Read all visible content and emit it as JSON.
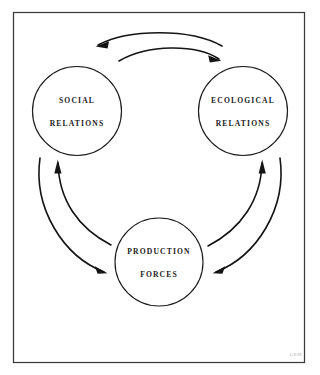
{
  "figure": {
    "background_color": "#ffffff",
    "ink_color": "#141414",
    "frame": {
      "name": "border-frame",
      "stroke_color": "#3b3b3b"
    },
    "monogram": {
      "text": "GEM",
      "color": "#b3b3b3"
    }
  },
  "nodes": [
    {
      "id": "social-relations",
      "line1": "SOCIAL",
      "line2": "RELATIONS",
      "cx": 77,
      "cy": 111,
      "r": 44.5
    },
    {
      "id": "ecological-relations",
      "line1": "ECOLOGICAL",
      "line2": "RELATIONS",
      "cx": 243,
      "cy": 111,
      "r": 44.5
    },
    {
      "id": "production-forces",
      "line1": "PRODUCTION",
      "line2": "FORCES",
      "cx": 159,
      "cy": 262,
      "r": 44.0
    }
  ],
  "arrows": [
    {
      "id": "ecological-to-social",
      "from": "ecological-relations",
      "to": "social-relations",
      "position": "top-outer"
    },
    {
      "id": "social-to-ecological",
      "from": "social-relations",
      "to": "ecological-relations",
      "position": "top-inner"
    },
    {
      "id": "social-to-production",
      "from": "social-relations",
      "to": "production-forces",
      "position": "left-outer"
    },
    {
      "id": "production-to-social",
      "from": "production-forces",
      "to": "social-relations",
      "position": "left-inner"
    },
    {
      "id": "production-to-ecological",
      "from": "production-forces",
      "to": "ecological-relations",
      "position": "right-inner"
    },
    {
      "id": "ecological-to-production",
      "from": "ecological-relations",
      "to": "production-forces",
      "position": "right-outer"
    }
  ]
}
